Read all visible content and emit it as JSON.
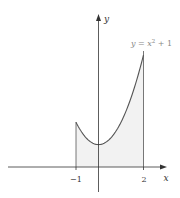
{
  "chart_data": {
    "type": "area",
    "title": "",
    "function_label": "y = x² + 1",
    "function_label_parts": {
      "lhs": "y = x",
      "exp": "2",
      "rhs": " + 1"
    },
    "xlabel": "x",
    "ylabel": "y",
    "x_ticks": [
      {
        "value": -1,
        "label": "−1"
      },
      {
        "value": 2,
        "label": "2"
      }
    ],
    "shaded_interval": [
      -1,
      2
    ],
    "x": [
      -1,
      -0.5,
      0,
      0.5,
      1,
      1.5,
      2
    ],
    "series": [
      {
        "name": "y = x^2 + 1",
        "values": [
          2,
          1.25,
          1,
          1.25,
          2,
          3.25,
          5
        ]
      }
    ],
    "xlim": [
      -4,
      3
    ],
    "ylim": [
      -1,
      7
    ],
    "grid": false,
    "legend": "none",
    "colors": {
      "curve": "#555555",
      "fill": "#f2f2f2",
      "axis": "#333333",
      "function_label": "#888888"
    }
  }
}
